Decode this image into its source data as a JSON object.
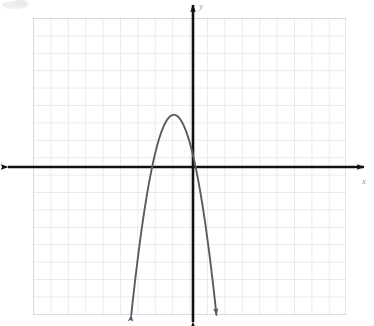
{
  "figure": {
    "kind": "coordinate-plane-graph",
    "background_color": "#ffffff",
    "axis_color": "#111111",
    "grid_color": "#c9c9d2",
    "grid_minor_color": "#dedee6",
    "curve_color": "#5a5a66",
    "x_axis_label": "x",
    "y_axis_label": "y",
    "corner_smudge": ""
  },
  "grid": {
    "left_px": 33,
    "right_px": 345,
    "top_px": 18,
    "bottom_px": 315,
    "cell_px": 17.4,
    "columns": 18,
    "rows": 17,
    "origin_x_px": 193,
    "origin_y_px": 167,
    "show_grid": true
  },
  "chart_data": {
    "type": "line",
    "title": "",
    "subtitle": "",
    "xlabel": "x",
    "ylabel": "y",
    "xlim": [
      -9.2,
      8.7
    ],
    "ylim": [
      -8.5,
      8.6
    ],
    "grid": true,
    "legend": null,
    "axis_tick_spacing": 1,
    "series": [
      {
        "name": "downward parabola",
        "shape": "parabola",
        "opens": "down",
        "equation": "y = -1.5(x + 0.75)^2 + 3",
        "vertex": [
          -1.1,
          3.0
        ],
        "x_intercepts": [
          -2.35,
          0.8
        ],
        "y_intercept": 1.2,
        "arrow_ends": [
          "left-down",
          "right-down"
        ],
        "x": [
          -3.6,
          -3.2,
          -2.8,
          -2.4,
          -2.0,
          -1.6,
          -1.2,
          -0.8,
          -0.4,
          0.0,
          0.4,
          0.8,
          1.2,
          1.6,
          2.1
        ],
        "values": [
          -8.5,
          -6.3,
          -4.3,
          -2.6,
          -1.2,
          -0.1,
          2.6,
          2.95,
          2.6,
          1.2,
          -0.1,
          -1.2,
          -2.6,
          -4.3,
          -8.5
        ]
      }
    ]
  },
  "curve_path": "M 130.5 303 C 137 285 146 256 155 228 C 163 203 169 181 173.8 158 C 176 146 177.5 128 180 118 C 182 112.5 186 110.5 190 113 C 194 116 197 126 200 138 C 204 154 209 176 215 200 C 221 226 226 254 230.5 275 L 234 303"
}
